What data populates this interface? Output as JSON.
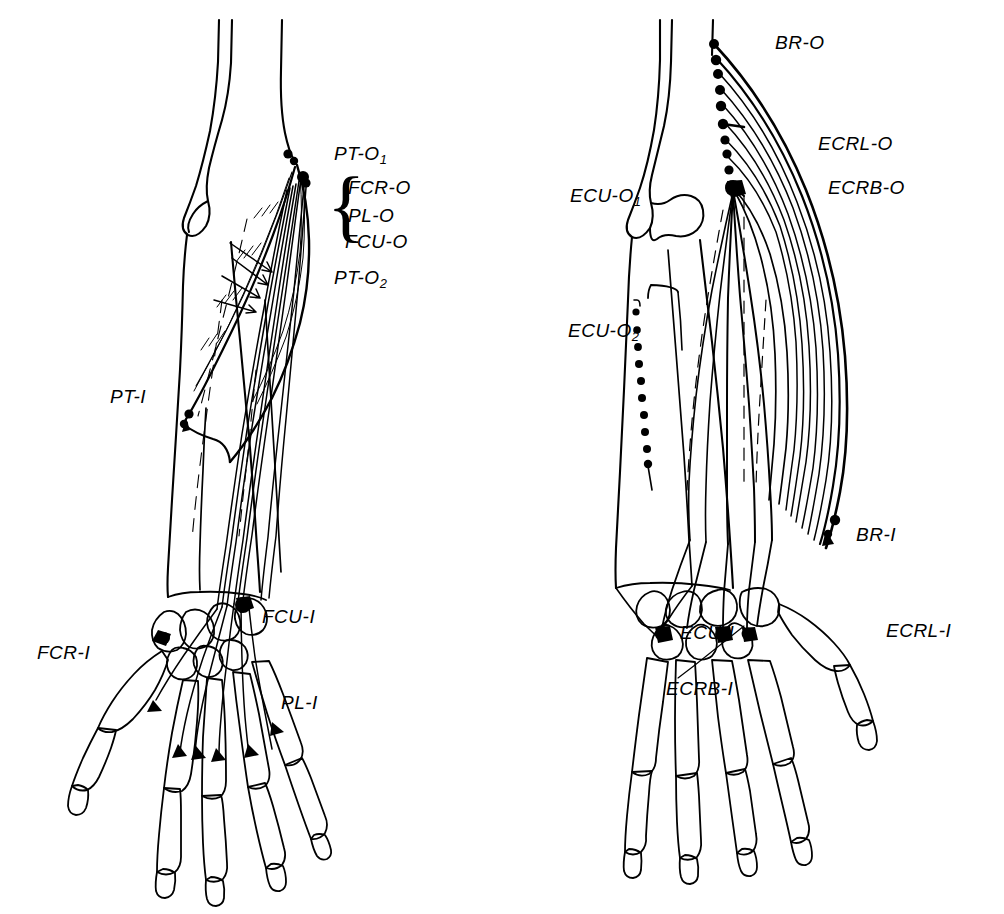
{
  "figure": {
    "kind": "anatomical-line-diagram",
    "stroke_color": "#000000",
    "background_color": "#ffffff"
  },
  "panels": [
    {
      "id": "left-forearm",
      "name": "flexor-forearm-diagram",
      "side": "left",
      "labels": [
        {
          "id": "pt-o1",
          "text": "PT-O",
          "sub": "1",
          "x": 334,
          "y": 143,
          "size": 19
        },
        {
          "id": "fcr-o",
          "text": "FCR-O",
          "sub": "",
          "x": 348,
          "y": 177,
          "size": 19
        },
        {
          "id": "pl-o",
          "text": "PL-O",
          "sub": "",
          "x": 348,
          "y": 205,
          "size": 19
        },
        {
          "id": "fcu-o",
          "text": "FCU-O",
          "sub": "",
          "x": 345,
          "y": 231,
          "size": 19
        },
        {
          "id": "pt-o2",
          "text": "PT-O",
          "sub": "2",
          "x": 334,
          "y": 267,
          "size": 19
        },
        {
          "id": "pt-i",
          "text": "PT-I",
          "sub": "",
          "x": 110,
          "y": 386,
          "size": 19
        },
        {
          "id": "fcu-i",
          "text": "FCU-I",
          "sub": "",
          "x": 262,
          "y": 606,
          "size": 19
        },
        {
          "id": "fcr-i",
          "text": "FCR-I",
          "sub": "",
          "x": 37,
          "y": 642,
          "size": 19
        },
        {
          "id": "pl-i",
          "text": "PL-I",
          "sub": "",
          "x": 281,
          "y": 692,
          "size": 19
        }
      ],
      "brace": {
        "id": "origin-group-brace",
        "x": 331,
        "y": 168,
        "height": 76
      }
    },
    {
      "id": "right-forearm",
      "name": "extensor-forearm-diagram",
      "side": "right",
      "labels": [
        {
          "id": "br-o",
          "text": "BR-O",
          "sub": "",
          "x": 775,
          "y": 32,
          "size": 19
        },
        {
          "id": "ecrl-o",
          "text": "ECRL-O",
          "sub": "",
          "x": 818,
          "y": 133,
          "size": 19
        },
        {
          "id": "ecrb-o",
          "text": "ECRB-O",
          "sub": "",
          "x": 828,
          "y": 177,
          "size": 19
        },
        {
          "id": "ecu-o1",
          "text": "ECU-O",
          "sub": "1",
          "x": 570,
          "y": 185,
          "size": 19
        },
        {
          "id": "ecu-o2",
          "text": "ECU-O",
          "sub": "2",
          "x": 568,
          "y": 320,
          "size": 19
        },
        {
          "id": "br-i",
          "text": "BR-I",
          "sub": "",
          "x": 856,
          "y": 524,
          "size": 19
        },
        {
          "id": "ecrl-i",
          "text": "ECRL-I",
          "sub": "",
          "x": 886,
          "y": 620,
          "size": 19
        },
        {
          "id": "ecu-i",
          "text": "ECU-I",
          "sub": "",
          "x": 680,
          "y": 622,
          "size": 19
        },
        {
          "id": "ecrb-i",
          "text": "ECRB-I",
          "sub": "",
          "x": 666,
          "y": 678,
          "size": 19
        }
      ]
    }
  ],
  "muscles": {
    "left_panel": [
      {
        "abbr": "PT",
        "origins": [
          "PT-O1",
          "PT-O2"
        ],
        "insertion": "PT-I"
      },
      {
        "abbr": "FCR",
        "origins": [
          "FCR-O"
        ],
        "insertion": "FCR-I"
      },
      {
        "abbr": "PL",
        "origins": [
          "PL-O"
        ],
        "insertion": "PL-I"
      },
      {
        "abbr": "FCU",
        "origins": [
          "FCU-O"
        ],
        "insertion": "FCU-I"
      }
    ],
    "right_panel": [
      {
        "abbr": "BR",
        "origins": [
          "BR-O"
        ],
        "insertion": "BR-I"
      },
      {
        "abbr": "ECRL",
        "origins": [
          "ECRL-O"
        ],
        "insertion": "ECRL-I"
      },
      {
        "abbr": "ECRB",
        "origins": [
          "ECRB-O"
        ],
        "insertion": "ECRB-I"
      },
      {
        "abbr": "ECU",
        "origins": [
          "ECU-O1",
          "ECU-O2"
        ],
        "insertion": "ECU-I"
      }
    ]
  }
}
